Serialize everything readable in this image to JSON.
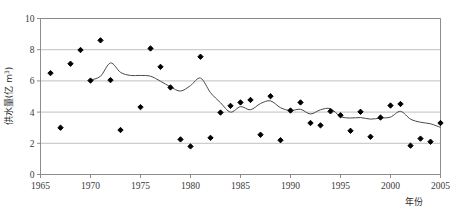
{
  "figure": {
    "top_partial_text": "",
    "background_color": "#ffffff",
    "plot_border_color": "#808080",
    "gridline_color": "#b0b0b0",
    "marker_color": "#000000",
    "trendline_color": "#4a4a4a"
  },
  "axes": {
    "x_title": "年份",
    "y_title_main": "供水量(亿 m",
    "y_title_sup": "3",
    "y_title_close": ")",
    "y_title_full": "供水量(亿 m³)",
    "x_ticks": [
      "1965",
      "1970",
      "1975",
      "1980",
      "1985",
      "1990",
      "1995",
      "2000",
      "2005"
    ],
    "y_ticks": [
      "0",
      "2",
      "4",
      "6",
      "8",
      "10"
    ]
  },
  "chart_data": {
    "type": "scatter",
    "title": "",
    "subtitle": "",
    "xlabel": "年份",
    "ylabel": "供水量(亿 m³)",
    "xlim": [
      1965,
      2005
    ],
    "ylim": [
      0,
      10
    ],
    "x_tick_interval": 5,
    "y_tick_interval": 2,
    "grid": "horizontal",
    "legend": "none",
    "series": [
      {
        "name": "供水量",
        "type": "scatter",
        "marker": "diamond",
        "color": "#000000",
        "points": [
          {
            "x": 1966,
            "y": 6.5
          },
          {
            "x": 1967,
            "y": 3.0
          },
          {
            "x": 1968,
            "y": 7.1
          },
          {
            "x": 1969,
            "y": 7.98
          },
          {
            "x": 1970,
            "y": 6.02
          },
          {
            "x": 1971,
            "y": 8.6
          },
          {
            "x": 1972,
            "y": 6.05
          },
          {
            "x": 1973,
            "y": 2.85
          },
          {
            "x": 1975,
            "y": 4.32
          },
          {
            "x": 1976,
            "y": 8.08
          },
          {
            "x": 1977,
            "y": 6.9
          },
          {
            "x": 1978,
            "y": 5.58
          },
          {
            "x": 1979,
            "y": 2.25
          },
          {
            "x": 1980,
            "y": 1.8
          },
          {
            "x": 1981,
            "y": 7.55
          },
          {
            "x": 1982,
            "y": 2.35
          },
          {
            "x": 1983,
            "y": 3.97
          },
          {
            "x": 1984,
            "y": 4.4
          },
          {
            "x": 1985,
            "y": 4.62
          },
          {
            "x": 1986,
            "y": 4.78
          },
          {
            "x": 1987,
            "y": 2.55
          },
          {
            "x": 1988,
            "y": 5.02
          },
          {
            "x": 1989,
            "y": 2.2
          },
          {
            "x": 1990,
            "y": 4.1
          },
          {
            "x": 1991,
            "y": 4.62
          },
          {
            "x": 1992,
            "y": 3.3
          },
          {
            "x": 1993,
            "y": 3.15
          },
          {
            "x": 1994,
            "y": 4.05
          },
          {
            "x": 1995,
            "y": 3.8
          },
          {
            "x": 1996,
            "y": 2.8
          },
          {
            "x": 1997,
            "y": 4.02
          },
          {
            "x": 1998,
            "y": 2.42
          },
          {
            "x": 1999,
            "y": 3.65
          },
          {
            "x": 2000,
            "y": 4.42
          },
          {
            "x": 2001,
            "y": 4.52
          },
          {
            "x": 2002,
            "y": 1.85
          },
          {
            "x": 2003,
            "y": 2.3
          },
          {
            "x": 2004,
            "y": 2.1
          },
          {
            "x": 2005,
            "y": 3.3
          }
        ]
      },
      {
        "name": "滑动平均",
        "type": "line",
        "color": "#4a4a4a",
        "points": [
          {
            "x": 1970,
            "y": 6.05
          },
          {
            "x": 1971,
            "y": 6.3
          },
          {
            "x": 1972,
            "y": 7.15
          },
          {
            "x": 1973,
            "y": 6.55
          },
          {
            "x": 1974,
            "y": 6.35
          },
          {
            "x": 1975,
            "y": 6.35
          },
          {
            "x": 1976,
            "y": 6.3
          },
          {
            "x": 1977,
            "y": 5.98
          },
          {
            "x": 1978,
            "y": 5.62
          },
          {
            "x": 1979,
            "y": 5.35
          },
          {
            "x": 1980,
            "y": 5.7
          },
          {
            "x": 1981,
            "y": 6.18
          },
          {
            "x": 1982,
            "y": 5.25
          },
          {
            "x": 1983,
            "y": 4.6
          },
          {
            "x": 1984,
            "y": 4.0
          },
          {
            "x": 1985,
            "y": 4.35
          },
          {
            "x": 1986,
            "y": 4.15
          },
          {
            "x": 1987,
            "y": 4.55
          },
          {
            "x": 1988,
            "y": 4.72
          },
          {
            "x": 1989,
            "y": 4.28
          },
          {
            "x": 1990,
            "y": 4.1
          },
          {
            "x": 1991,
            "y": 4.18
          },
          {
            "x": 1992,
            "y": 3.88
          },
          {
            "x": 1993,
            "y": 4.15
          },
          {
            "x": 1994,
            "y": 4.22
          },
          {
            "x": 1995,
            "y": 3.72
          },
          {
            "x": 1996,
            "y": 3.62
          },
          {
            "x": 1997,
            "y": 3.65
          },
          {
            "x": 1998,
            "y": 3.55
          },
          {
            "x": 1999,
            "y": 3.62
          },
          {
            "x": 2000,
            "y": 3.68
          },
          {
            "x": 2001,
            "y": 4.05
          },
          {
            "x": 2002,
            "y": 3.55
          },
          {
            "x": 2003,
            "y": 3.35
          },
          {
            "x": 2004,
            "y": 3.25
          },
          {
            "x": 2005,
            "y": 3.02
          }
        ]
      }
    ]
  }
}
